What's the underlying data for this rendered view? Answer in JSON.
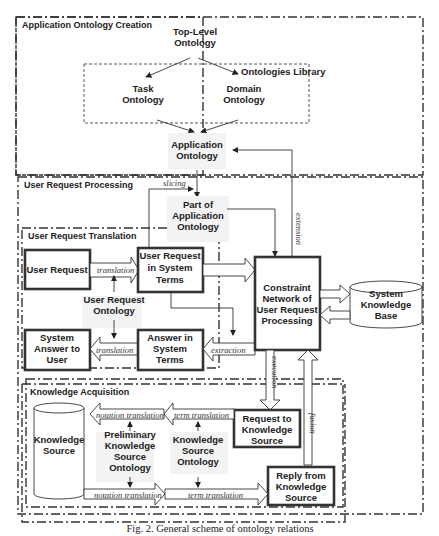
{
  "groups": {
    "app_ontology_creation": "Application Ontology Creation",
    "user_request_processing": "User Request Processing",
    "user_request_translation": "User Request Translation",
    "knowledge_acquisition": "Knowledge Acquisition",
    "ontologies_library": "Ontologies Library"
  },
  "nodes": {
    "top_level": [
      "Top-Level",
      "Ontology"
    ],
    "task": [
      "Task",
      "Ontology"
    ],
    "domain": [
      "Domain",
      "Ontology"
    ],
    "application": [
      "Application",
      "Ontology"
    ],
    "part_of_app": [
      "Part of",
      "Application",
      "Ontology"
    ],
    "user_request": [
      "User Request"
    ],
    "user_request_system": [
      "User Request",
      "in System",
      "Terms"
    ],
    "user_request_ontology": [
      "User Request",
      "Ontology"
    ],
    "system_answer": [
      "System",
      "Answer to",
      "User"
    ],
    "answer_system": [
      "Answer in",
      "System",
      "Terms"
    ],
    "constraint_network": [
      "Constraint",
      "Network of",
      "User Request",
      "Processing"
    ],
    "system_kb": [
      "System",
      "Knowledge",
      "Base"
    ],
    "knowledge_source": [
      "Knowledge",
      "Source"
    ],
    "prelim_ks_ontology": [
      "Preliminary",
      "Knowledge",
      "Source",
      "Ontology"
    ],
    "ks_ontology": [
      "Knowledge",
      "Source",
      "Ontology"
    ],
    "request_ks": [
      "Request to",
      "Knowledge",
      "Source"
    ],
    "reply_ks": [
      "Reply from",
      "Knowledge",
      "Source"
    ]
  },
  "edge_labels": {
    "slicing": "slicing",
    "extension": "extension",
    "translation_top": "translation",
    "translation_bottom": "translation",
    "extraction": "extraction",
    "execution": "execution",
    "fusion": "fusion",
    "notation_translation_top": "notation translation",
    "term_translation_top": "term translation",
    "notation_translation_bottom": "notation translation",
    "term_translation_bottom": "term translation"
  },
  "caption": "Fig. 2. General scheme of ontology relations"
}
